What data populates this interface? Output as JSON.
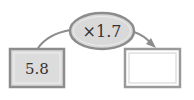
{
  "diagram": {
    "operator": {
      "text": "×1.7",
      "fill": "#d9d9d9",
      "stroke": "#8c8c8c"
    },
    "input_box": {
      "value": "5.8",
      "fill": "#dcdcdc",
      "stroke": "#8c8c8c"
    },
    "output_box": {
      "value": "",
      "fill": "#ffffff",
      "stroke": "#9a9a9a"
    },
    "arrow_color": "#8c8c8c"
  }
}
